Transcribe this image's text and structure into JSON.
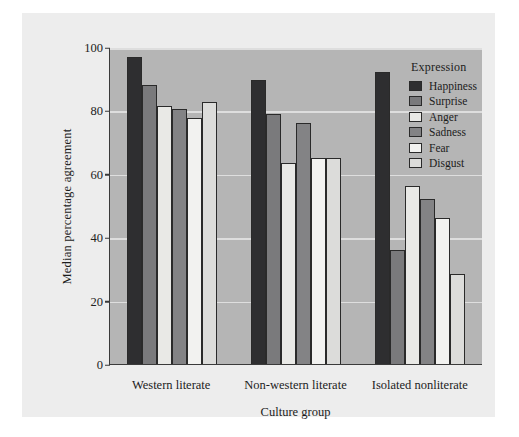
{
  "chart_data": {
    "type": "bar",
    "title": "",
    "xlabel": "Culture group",
    "ylabel": "Median percentage agreement",
    "categories": [
      "Western literate",
      "Non-western literate",
      "Isolated nonliterate"
    ],
    "ylim": [
      0,
      100
    ],
    "yticks": [
      0,
      20,
      40,
      60,
      80,
      100
    ],
    "grid": true,
    "legend_title": "Expression",
    "legend_position": "top-right inside plot",
    "series": [
      {
        "name": "Happiness",
        "color": "#2e2e30",
        "values": [
          97,
          89.5,
          92
        ]
      },
      {
        "name": "Surprise",
        "color": "#7a7a7c",
        "values": [
          88,
          79,
          36
        ]
      },
      {
        "name": "Anger",
        "color": "#e9e9e6",
        "values": [
          81.5,
          63.5,
          56
        ]
      },
      {
        "name": "Sadness",
        "color": "#838385",
        "values": [
          80.5,
          76,
          52
        ]
      },
      {
        "name": "Fear",
        "color": "#f2f2f0",
        "values": [
          77.5,
          65,
          46
        ]
      },
      {
        "name": "Disgust",
        "color": "#dcdcda",
        "values": [
          82.5,
          65,
          28.5
        ]
      }
    ]
  },
  "colors": {
    "page_background": "#ffffff",
    "figure_background": "#ededed",
    "plot_background": "#b5b5b5",
    "gridline": "#dedede",
    "axis": "#3a3a3a",
    "text": "#1c1c1c"
  }
}
